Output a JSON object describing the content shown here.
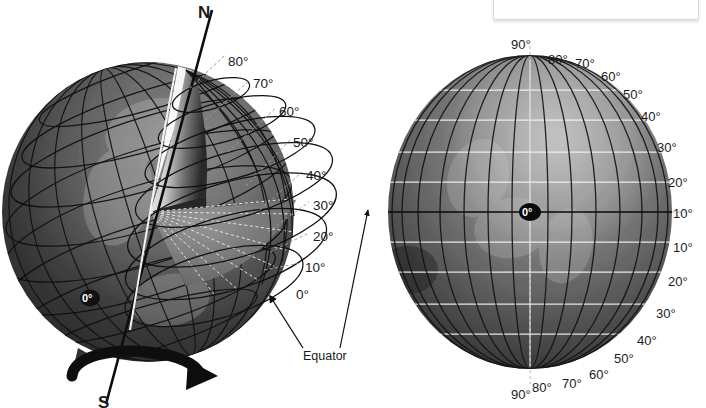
{
  "figure": {
    "caption": "various angles of latitude on these globes.",
    "background_color": "#ffffff"
  },
  "colors": {
    "globe_dark": "#2b2b2b",
    "globe_mid": "#6d6d6d",
    "globe_light": "#b9b9b9",
    "grid_line": "#111111",
    "latitude_line": "#f2f2f2",
    "label_text": "#1b1b1b",
    "caption_text": "#8d8d8d",
    "callout_border": "#d8d8d8",
    "leader_line": "#9a9a9a"
  },
  "left_globe": {
    "name": "cutaway-globe",
    "description": "Cutaway sphere with wedge removed showing latitude angle cones from center",
    "center": {
      "cx": 148,
      "cy": 212,
      "rx": 146,
      "ry": 150
    },
    "axis": {
      "name": "rotation-axis",
      "north_label": "N",
      "south_label": "S"
    },
    "center_marker": "0°",
    "equator_label": "Equator",
    "latitude_labels": [
      {
        "value": "80°",
        "x": 228,
        "y": 55
      },
      {
        "value": "70°",
        "x": 253,
        "y": 77
      },
      {
        "value": "60°",
        "x": 279,
        "y": 105
      },
      {
        "value": "50°",
        "x": 293,
        "y": 136
      },
      {
        "value": "40°",
        "x": 306,
        "y": 169
      },
      {
        "value": "30°",
        "x": 313,
        "y": 199
      },
      {
        "value": "20°",
        "x": 313,
        "y": 230
      },
      {
        "value": "10°",
        "x": 305,
        "y": 261
      },
      {
        "value": "0°",
        "x": 296,
        "y": 288
      }
    ]
  },
  "right_globe": {
    "name": "full-globe",
    "description": "Full sphere with latitude and longitude grid, equator at center",
    "center": {
      "cx": 530,
      "cy": 212,
      "rx": 142,
      "ry": 157
    },
    "center_marker": "0°",
    "latitude_labels_north": [
      {
        "value": "90°",
        "x": 511,
        "y": 38
      },
      {
        "value": "80°",
        "x": 548,
        "y": 53
      },
      {
        "value": "70°",
        "x": 575,
        "y": 57
      },
      {
        "value": "60°",
        "x": 601,
        "y": 70
      },
      {
        "value": "50°",
        "x": 623,
        "y": 88
      },
      {
        "value": "40°",
        "x": 641,
        "y": 110
      },
      {
        "value": "30°",
        "x": 657,
        "y": 141
      },
      {
        "value": "20°",
        "x": 668,
        "y": 176
      },
      {
        "value": "10°",
        "x": 673,
        "y": 207
      }
    ],
    "latitude_labels_south": [
      {
        "value": "10°",
        "x": 673,
        "y": 241
      },
      {
        "value": "20°",
        "x": 668,
        "y": 275
      },
      {
        "value": "30°",
        "x": 656,
        "y": 307
      },
      {
        "value": "40°",
        "x": 637,
        "y": 334
      },
      {
        "value": "50°",
        "x": 614,
        "y": 352
      },
      {
        "value": "60°",
        "x": 589,
        "y": 368
      },
      {
        "value": "70°",
        "x": 562,
        "y": 377
      },
      {
        "value": "80°",
        "x": 532,
        "y": 381
      },
      {
        "value": "90°",
        "x": 511,
        "y": 388
      }
    ]
  },
  "annotations": {
    "equator_callout": "Equator"
  }
}
